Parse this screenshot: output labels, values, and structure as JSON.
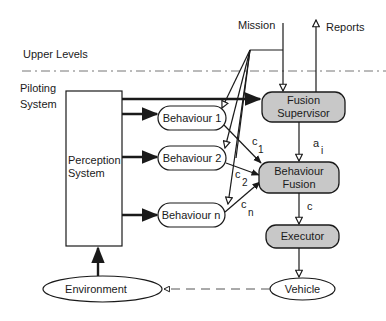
{
  "labels": {
    "upper_levels": "Upper Levels",
    "piloting_line1": "Piloting",
    "piloting_line2": "System",
    "mission": "Mission",
    "reports": "Reports"
  },
  "nodes": {
    "perception_line1": "Perception",
    "perception_line2": "System",
    "behaviour1": "Behaviour 1",
    "behaviour2": "Behaviour 2",
    "behaviourn": "Behaviour n",
    "fusion_supervisor_line1": "Fusion",
    "fusion_supervisor_line2": "Supervisor",
    "behaviour_fusion_line1": "Behaviour",
    "behaviour_fusion_line2": "Fusion",
    "executor": "Executor",
    "environment": "Environment",
    "vehicle": "Vehicle"
  },
  "edge_labels": {
    "c1_main": "c",
    "c1_sub": "1",
    "c2_main": "c",
    "c2_sub": "2",
    "cn_main": "c",
    "cn_sub": "n",
    "ai_main": "a",
    "ai_sub": "i",
    "c": "c"
  },
  "colors": {
    "process_fill": "#c8c8c8",
    "stroke": "#1a1a1a",
    "background": "#ffffff"
  }
}
